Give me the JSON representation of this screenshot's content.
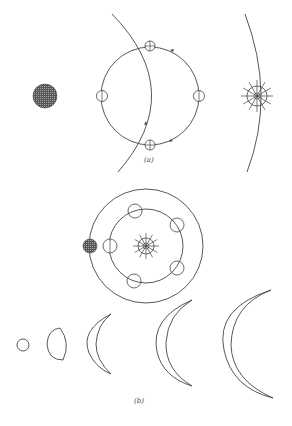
{
  "figure": {
    "panel_a": {
      "label": "(a)",
      "description": "Ptolemaic epicycle model of Venus: Venus moves on an epicycle whose center lies on the Earth-Sun line; deferent arc passes through the epicycle",
      "earth": {
        "cx": 45,
        "cy": 96,
        "r": 12,
        "style": "hatched-dark"
      },
      "epicycle": {
        "cx": 150,
        "cy": 96,
        "r": 49
      },
      "venus_positions": [
        {
          "cx": 102,
          "cy": 96,
          "r": 6,
          "symbol": "circle-half"
        },
        {
          "cx": 150,
          "cy": 46,
          "r": 6,
          "symbol": "circle-plus"
        },
        {
          "cx": 199,
          "cy": 96,
          "r": 6,
          "symbol": "circle-half"
        },
        {
          "cx": 150,
          "cy": 145,
          "r": 6,
          "symbol": "circle-plus"
        }
      ],
      "sun": {
        "cx": 257,
        "cy": 96,
        "r": 10,
        "rays": 12
      },
      "arcs": [
        "deferent-arc",
        "sun-orbit-arc"
      ],
      "arrows": [
        "epicycle-arrow-top",
        "epicycle-arrow-bottom",
        "deferent-arrow"
      ]
    },
    "panel_b": {
      "label": "(b)",
      "description": "Copernican heliocentric model: Venus orbits the Sun inside Earth's orbit; below, observed phases of Venus varying in size and shape",
      "sun": {
        "cx": 146,
        "cy": 246,
        "r": 10,
        "rays": 12
      },
      "earth_orbit": {
        "cx": 146,
        "cy": 246,
        "r": 57
      },
      "venus_orbit": {
        "cx": 146,
        "cy": 246,
        "r": 37
      },
      "earth": {
        "cx": 90,
        "cy": 246,
        "r": 7,
        "style": "hatched-dark"
      },
      "venus_positions": [
        {
          "cx": 110,
          "cy": 246
        },
        {
          "cx": 135,
          "cy": 211
        },
        {
          "cx": 177,
          "cy": 225
        },
        {
          "cx": 177,
          "cy": 268
        },
        {
          "cx": 134,
          "cy": 281
        }
      ],
      "phases": [
        "full",
        "gibbous",
        "crescent-small",
        "crescent-medium",
        "crescent-large"
      ]
    }
  }
}
